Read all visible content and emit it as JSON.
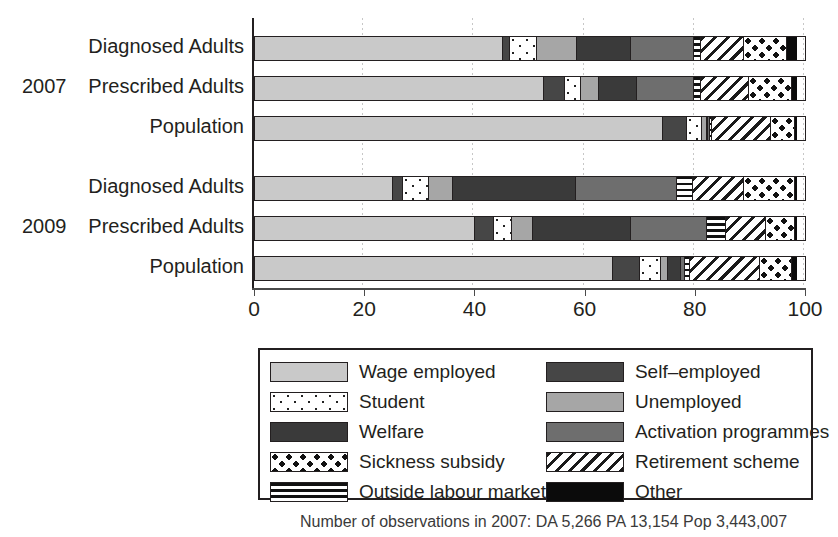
{
  "chart_data": {
    "type": "bar",
    "orientation": "horizontal",
    "stacked": true,
    "title": "",
    "xlabel": "",
    "ylabel": "",
    "xlim": [
      0,
      100
    ],
    "xticks": [
      0,
      20,
      40,
      60,
      80,
      100
    ],
    "xticklabels": [
      "0",
      "20",
      "40",
      "60",
      "80",
      "100"
    ],
    "grid": true,
    "legend_position": "below-plot-boxed",
    "groups": [
      "2007",
      "2009"
    ],
    "categories": [
      "Diagnosed Adults",
      "Prescribed Adults",
      "Population",
      "Diagnosed Adults",
      "Prescribed Adults",
      "Population"
    ],
    "series": [
      {
        "name": "Wage employed",
        "key": "wage",
        "values": [
          45.0,
          52.5,
          74.0,
          25.0,
          40.0,
          65.0
        ]
      },
      {
        "name": "Self-employed",
        "key": "self",
        "values": [
          1.5,
          4.0,
          4.5,
          2.0,
          3.5,
          5.0
        ]
      },
      {
        "name": "Student",
        "key": "student",
        "values": [
          5.0,
          3.0,
          3.0,
          5.0,
          3.5,
          4.0
        ]
      },
      {
        "name": "Unemployed",
        "key": "unemp",
        "values": [
          7.5,
          3.5,
          1.0,
          4.5,
          4.0,
          1.5
        ]
      },
      {
        "name": "Welfare",
        "key": "welfare",
        "values": [
          10.0,
          7.0,
          0.5,
          22.5,
          18.0,
          2.5
        ]
      },
      {
        "name": "Activation programmes",
        "key": "activation",
        "values": [
          11.5,
          10.5,
          0.5,
          18.5,
          14.0,
          1.0
        ]
      },
      {
        "name": "Outside labour market",
        "key": "outside",
        "values": [
          1.5,
          1.5,
          0.5,
          3.0,
          3.5,
          1.0
        ]
      },
      {
        "name": "Retirement scheme",
        "key": "retire",
        "values": [
          8.0,
          9.0,
          11.0,
          9.5,
          7.5,
          13.0
        ]
      },
      {
        "name": "Sickness subsidy",
        "key": "sick",
        "values": [
          8.0,
          8.0,
          4.5,
          9.5,
          5.5,
          6.0
        ]
      },
      {
        "name": "Other",
        "key": "other",
        "values": [
          2.0,
          1.0,
          0.5,
          0.5,
          0.5,
          1.0
        ]
      }
    ]
  },
  "axis": {
    "ticks": [
      {
        "value": 0,
        "label": "0"
      },
      {
        "value": 20,
        "label": "20"
      },
      {
        "value": 40,
        "label": "40"
      },
      {
        "value": 60,
        "label": "60"
      },
      {
        "value": 80,
        "label": "80"
      },
      {
        "value": 100,
        "label": "100"
      }
    ]
  },
  "y_axis": {
    "group_2007_label": "2007",
    "group_2009_label": "2009",
    "rows": [
      {
        "label": "Diagnosed Adults"
      },
      {
        "label": "Prescribed Adults"
      },
      {
        "label": "Population"
      },
      {
        "label": "Diagnosed Adults"
      },
      {
        "label": "Prescribed Adults"
      },
      {
        "label": "Population"
      }
    ]
  },
  "legend": {
    "items": [
      {
        "label": "Wage employed",
        "fill": "f-wage"
      },
      {
        "label": "Self–employed",
        "fill": "f-self"
      },
      {
        "label": "Student",
        "fill": "f-student"
      },
      {
        "label": "Unemployed",
        "fill": "f-unemp"
      },
      {
        "label": "Welfare",
        "fill": "f-welfare"
      },
      {
        "label": "Activation programmes",
        "fill": "f-activation"
      },
      {
        "label": "Sickness subsidy",
        "fill": "f-sick"
      },
      {
        "label": "Retirement scheme",
        "fill": "f-retire"
      },
      {
        "label": "Outside labour market",
        "fill": "f-outside"
      },
      {
        "label": "Other",
        "fill": "f-other"
      }
    ]
  },
  "caption": {
    "text": "Number of observations in 2007: DA 5,266   PA 13,154   Pop 3,443,007"
  },
  "colors": {
    "axis": "#231f20",
    "grid": "#c7c7c7",
    "wage": "#c9c9c9",
    "self": "#464646",
    "unemployed": "#a6a6a6",
    "welfare": "#3a3a3a",
    "activation": "#6e6e6e",
    "other": "#0b0b0b"
  }
}
